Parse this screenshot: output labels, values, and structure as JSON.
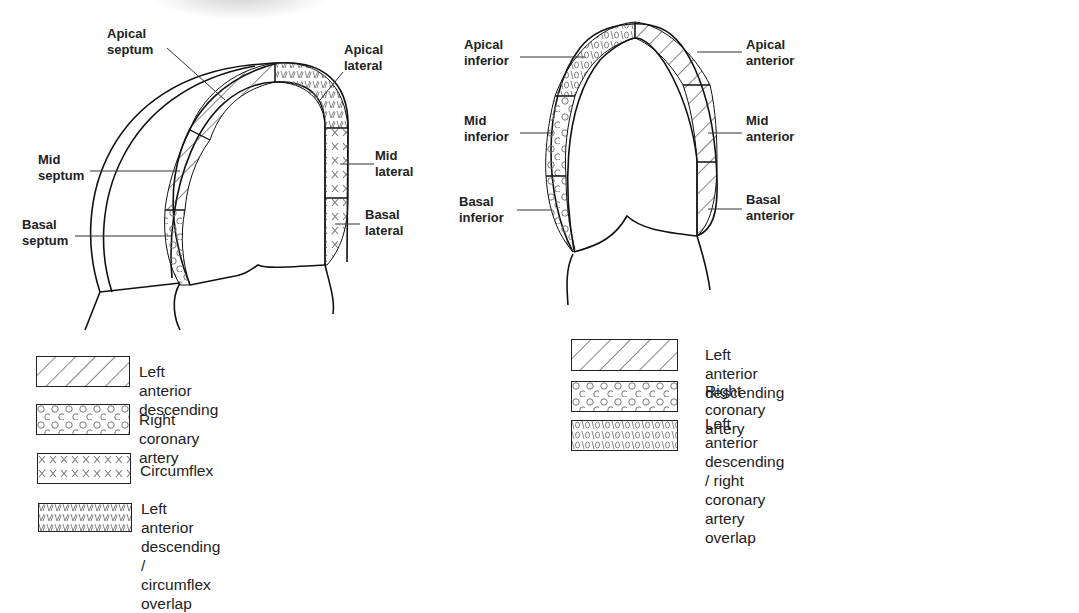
{
  "figure": {
    "views": [
      {
        "id": "four-chamber-view",
        "segments": [
          {
            "name": "Apical septum",
            "line1": "Apical",
            "line2": "septum",
            "territory": "lad"
          },
          {
            "name": "Mid septum",
            "line1": "Mid",
            "line2": "septum",
            "territory": "lad"
          },
          {
            "name": "Basal septum",
            "line1": "Basal",
            "line2": "septum",
            "territory": "rca"
          },
          {
            "name": "Apical lateral",
            "line1": "Apical",
            "line2": "lateral",
            "territory": "lad_cx_overlap"
          },
          {
            "name": "Mid lateral",
            "line1": "Mid",
            "line2": "lateral",
            "territory": "cx"
          },
          {
            "name": "Basal lateral",
            "line1": "Basal",
            "line2": "lateral",
            "territory": "cx"
          }
        ],
        "legend": [
          {
            "pattern": "lad",
            "label": "Left anterior descending"
          },
          {
            "pattern": "rca",
            "label": "Right coronary artery"
          },
          {
            "pattern": "cx",
            "label": "Circumflex"
          },
          {
            "pattern": "lad_cx_overlap",
            "label_line1": "Left anterior descending /",
            "label_line2": "circumflex overlap"
          }
        ]
      },
      {
        "id": "two-chamber-view",
        "segments": [
          {
            "name": "Apical inferior",
            "line1": "Apical",
            "line2": "inferior",
            "territory": "lad_rca_overlap"
          },
          {
            "name": "Mid inferior",
            "line1": "Mid",
            "line2": "inferior",
            "territory": "rca"
          },
          {
            "name": "Basal inferior",
            "line1": "Basal",
            "line2": "inferior",
            "territory": "rca"
          },
          {
            "name": "Apical anterior",
            "line1": "Apical",
            "line2": "anterior",
            "territory": "lad"
          },
          {
            "name": "Mid anterior",
            "line1": "Mid",
            "line2": "anterior",
            "territory": "lad"
          },
          {
            "name": "Basal anterior",
            "line1": "Basal",
            "line2": "anterior",
            "territory": "lad"
          }
        ],
        "legend": [
          {
            "pattern": "lad",
            "label": "Left anterior descending"
          },
          {
            "pattern": "rca",
            "label": "Right coronary artery"
          },
          {
            "pattern": "lad_rca_overlap",
            "label_line1": "Left anterior descending / right coronary",
            "label_line2": "artery overlap"
          }
        ]
      }
    ],
    "colors": {
      "stroke": "#111111",
      "pattern": "#555555",
      "background": "#ffffff"
    }
  }
}
